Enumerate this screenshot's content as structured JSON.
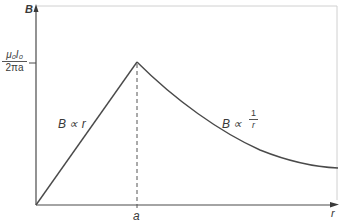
{
  "diagram": {
    "y_axis_label": "B",
    "x_axis_label": "r",
    "x_tick_label": "a",
    "y_tick_label": {
      "numerator": "μ₀I₀",
      "denominator": "2πa"
    },
    "inner_region_label": "B ∝ r",
    "outer_region_label": {
      "prefix": "B ∝",
      "numerator": "1",
      "denominator": "r"
    },
    "colors": {
      "curve": "#4a4a4a",
      "axis": "#4a4a4a",
      "frame": "#cfcfcf",
      "text": "#3a3a3a"
    }
  }
}
